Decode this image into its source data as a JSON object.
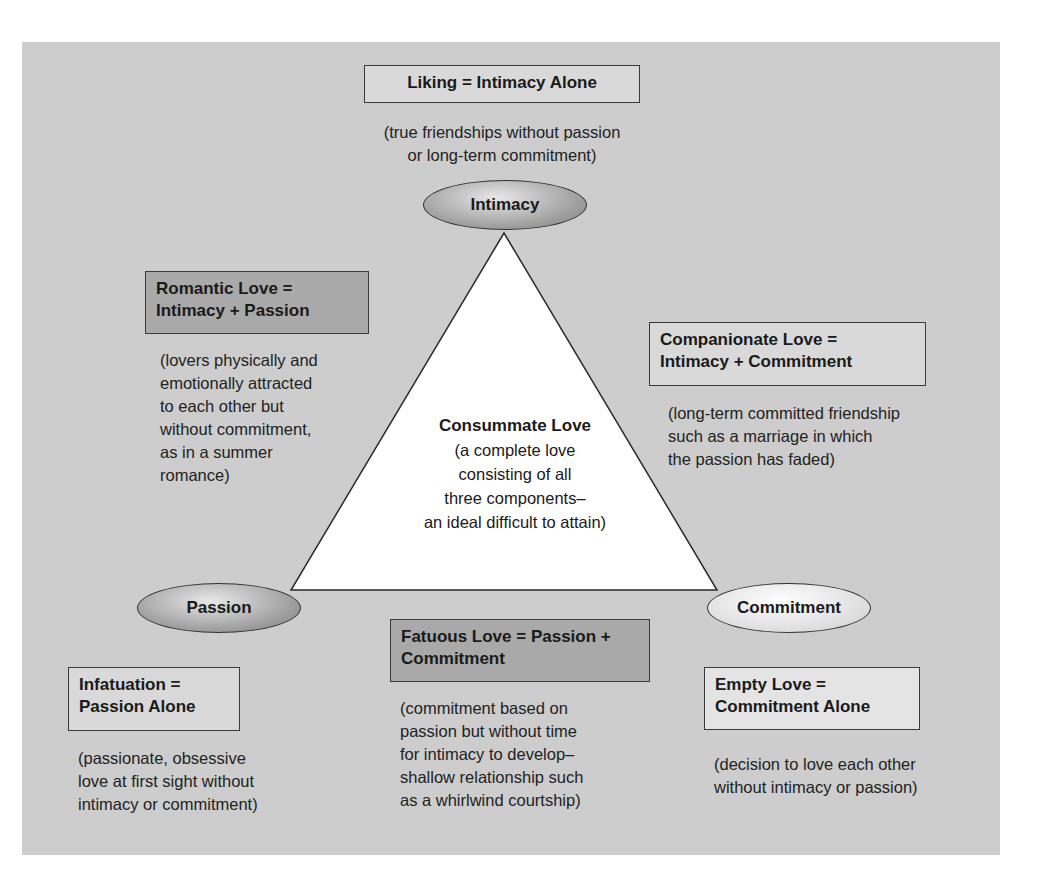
{
  "diagram": {
    "type": "triangle",
    "vertices": {
      "top": {
        "label": "Intimacy",
        "shade": "dark"
      },
      "left": {
        "label": "Passion",
        "shade": "dark"
      },
      "right": {
        "label": "Commitment",
        "shade": "light"
      }
    },
    "center": {
      "title": "Consummate Love",
      "lines": [
        "(a complete love",
        "consisting of all",
        "three components–",
        "an ideal difficult to attain)"
      ]
    },
    "types": {
      "liking": {
        "title_lines": [
          "Liking = Intimacy Alone"
        ],
        "desc_lines": [
          "(true friendships without passion",
          "or long-term commitment)"
        ]
      },
      "romantic": {
        "title_lines": [
          "Romantic Love =",
          "Intimacy + Passion"
        ],
        "desc_lines": [
          "(lovers physically and",
          "emotionally attracted",
          "to each other but",
          "without commitment,",
          "as in a summer",
          "romance)"
        ]
      },
      "companionate": {
        "title_lines": [
          "Companionate Love =",
          "Intimacy + Commitment"
        ],
        "desc_lines": [
          "(long-term committed friendship",
          "such as a marriage in which",
          "the passion has faded)"
        ]
      },
      "fatuous": {
        "title_lines": [
          "Fatuous Love = Passion +",
          "Commitment"
        ],
        "desc_lines": [
          "(commitment based on",
          "passion but without time",
          "for intimacy to develop–",
          "shallow relationship such",
          "as a whirlwind courtship)"
        ]
      },
      "infatuation": {
        "title_lines": [
          "Infatuation =",
          "Passion Alone"
        ],
        "desc_lines": [
          "(passionate, obsessive",
          "love at first sight without",
          "intimacy or commitment)"
        ]
      },
      "empty": {
        "title_lines": [
          "Empty Love =",
          "Commitment Alone"
        ],
        "desc_lines": [
          "(decision to love each other",
          "without intimacy or passion)"
        ]
      }
    },
    "colors": {
      "panel": "#cdcdcd",
      "triangle_fill": "#ffffff",
      "border": "#3a3a3a"
    }
  }
}
